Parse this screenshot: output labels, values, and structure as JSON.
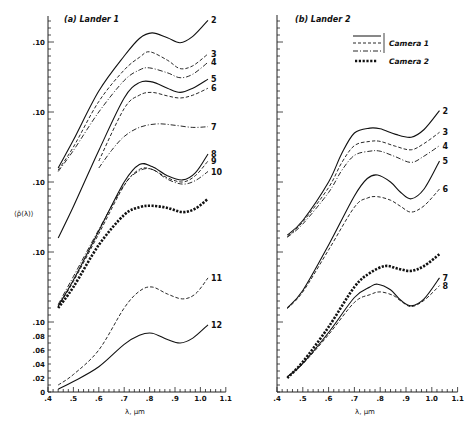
{
  "chart_data": {
    "type": "line",
    "ylabel": "⟨ρ̄(λ)⟩",
    "xlabel": "λ, μm",
    "x_ticks": [
      ".4",
      ".5",
      ".6",
      ".7",
      ".8",
      ".9",
      "1.0",
      "1.1"
    ],
    "x_tick_values": [
      0.4,
      0.5,
      0.6,
      0.7,
      0.8,
      0.9,
      1.0,
      1.1
    ],
    "xlim": [
      0.4,
      1.1
    ],
    "ylim": [
      0,
      0.54
    ],
    "y_note": "Curves are offset vertically; each '.10' label marks a repeated 0.10 reference for the stacked curves.",
    "legend": {
      "placement": "top-right of panel (b)",
      "entries": [
        {
          "label": "Camera 1",
          "styles": [
            "solid",
            "dashed",
            "dash-dot"
          ]
        },
        {
          "label": "Camera 2",
          "styles": [
            "bold-dotted"
          ]
        }
      ]
    },
    "panels": [
      {
        "title": "(a) Lander 1",
        "y_tick_labels": [
          {
            "label": "0",
            "value": 0.0
          },
          {
            "label": ".02",
            "value": 0.02
          },
          {
            "label": ".04",
            "value": 0.04
          },
          {
            "label": ".06",
            "value": 0.06
          },
          {
            "label": ".08",
            "value": 0.08
          },
          {
            "label": ".10",
            "value": 0.1
          },
          {
            "label": ".10",
            "value": 0.2
          },
          {
            "label": ".10",
            "value": 0.3
          },
          {
            "label": ".10",
            "value": 0.4
          },
          {
            "label": ".10",
            "value": 0.5
          }
        ],
        "series": [
          {
            "name": "2",
            "camera": "Camera 1",
            "style": "solid",
            "x": [
              0.44,
              0.5,
              0.6,
              0.7,
              0.76,
              0.81,
              0.87,
              0.92,
              0.97,
              1.03
            ],
            "y": [
              0.32,
              0.36,
              0.43,
              0.48,
              0.505,
              0.513,
              0.506,
              0.499,
              0.508,
              0.531
            ]
          },
          {
            "name": "3",
            "camera": "Camera 1",
            "style": "dashed",
            "x": [
              0.44,
              0.5,
              0.6,
              0.7,
              0.76,
              0.8,
              0.87,
              0.92,
              0.97,
              1.03
            ],
            "y": [
              0.317,
              0.35,
              0.415,
              0.46,
              0.478,
              0.486,
              0.474,
              0.462,
              0.466,
              0.483
            ]
          },
          {
            "name": "4",
            "camera": "Camera 1",
            "style": "dash-dot",
            "x": [
              0.44,
              0.5,
              0.6,
              0.7,
              0.76,
              0.8,
              0.87,
              0.92,
              0.97,
              1.03
            ],
            "y": [
              0.315,
              0.345,
              0.4,
              0.445,
              0.46,
              0.463,
              0.456,
              0.449,
              0.454,
              0.471
            ]
          },
          {
            "name": "5",
            "camera": "Camera 1",
            "style": "solid",
            "x": [
              0.44,
              0.5,
              0.6,
              0.7,
              0.76,
              0.81,
              0.87,
              0.92,
              0.97,
              1.03
            ],
            "y": [
              0.22,
              0.265,
              0.345,
              0.42,
              0.442,
              0.443,
              0.434,
              0.428,
              0.434,
              0.447
            ]
          },
          {
            "name": "6",
            "camera": "Camera 1",
            "style": "dashed",
            "x": [
              0.6,
              0.7,
              0.76,
              0.81,
              0.87,
              0.92,
              0.97,
              1.03
            ],
            "y": [
              0.33,
              0.405,
              0.424,
              0.428,
              0.423,
              0.42,
              0.424,
              0.434
            ]
          },
          {
            "name": "7",
            "camera": "Camera 1",
            "style": "dash-dot",
            "x": [
              0.6,
              0.65,
              0.7,
              0.76,
              0.83,
              0.9,
              0.97,
              1.03
            ],
            "y": [
              0.32,
              0.345,
              0.365,
              0.378,
              0.383,
              0.381,
              0.378,
              0.379
            ]
          },
          {
            "name": "8",
            "camera": "Camera 1",
            "style": "solid",
            "x": [
              0.44,
              0.5,
              0.6,
              0.7,
              0.76,
              0.81,
              0.87,
              0.93,
              0.98,
              1.03
            ],
            "y": [
              0.123,
              0.16,
              0.23,
              0.3,
              0.325,
              0.322,
              0.309,
              0.303,
              0.313,
              0.34
            ]
          },
          {
            "name": "9",
            "camera": "Camera 1",
            "style": "dashed",
            "x": [
              0.44,
              0.5,
              0.6,
              0.7,
              0.76,
              0.81,
              0.87,
              0.93,
              0.98,
              1.03
            ],
            "y": [
              0.122,
              0.158,
              0.226,
              0.295,
              0.318,
              0.318,
              0.306,
              0.3,
              0.309,
              0.33
            ]
          },
          {
            "name": "10",
            "camera": "Camera 1",
            "style": "dash-dot",
            "x": [
              0.44,
              0.5,
              0.6,
              0.7,
              0.76,
              0.81,
              0.87,
              0.93,
              0.98,
              1.03
            ],
            "y": [
              0.125,
              0.165,
              0.232,
              0.296,
              0.316,
              0.318,
              0.304,
              0.297,
              0.302,
              0.315
            ]
          },
          {
            "name": "Camera 2 (a)",
            "camera": "Camera 2",
            "style": "bold-dotted",
            "x": [
              0.44,
              0.5,
              0.6,
              0.7,
              0.76,
              0.81,
              0.87,
              0.93,
              0.98,
              1.03
            ],
            "y": [
              0.12,
              0.15,
              0.21,
              0.253,
              0.264,
              0.266,
              0.263,
              0.257,
              0.262,
              0.276
            ]
          },
          {
            "name": "11",
            "camera": "Camera 1",
            "style": "dashed",
            "x": [
              0.44,
              0.5,
              0.6,
              0.7,
              0.76,
              0.81,
              0.87,
              0.93,
              0.98,
              1.03
            ],
            "y": [
              0.01,
              0.025,
              0.06,
              0.12,
              0.144,
              0.15,
              0.14,
              0.133,
              0.14,
              0.163
            ]
          },
          {
            "name": "12",
            "camera": "Camera 1",
            "style": "solid",
            "x": [
              0.44,
              0.5,
              0.6,
              0.7,
              0.76,
              0.81,
              0.87,
              0.92,
              0.97,
              1.03
            ],
            "y": [
              0.004,
              0.015,
              0.036,
              0.068,
              0.081,
              0.084,
              0.075,
              0.07,
              0.077,
              0.096
            ]
          }
        ]
      },
      {
        "title": "(b) Lander 2",
        "y_tick_labels": [],
        "series": [
          {
            "name": "2",
            "camera": "Camera 1",
            "style": "solid",
            "x": [
              0.44,
              0.5,
              0.6,
              0.65,
              0.7,
              0.76,
              0.8,
              0.86,
              0.92,
              0.97,
              1.03
            ],
            "y": [
              0.224,
              0.245,
              0.3,
              0.34,
              0.37,
              0.377,
              0.376,
              0.368,
              0.364,
              0.375,
              0.402
            ]
          },
          {
            "name": "3",
            "camera": "Camera 1",
            "style": "dashed",
            "x": [
              0.44,
              0.5,
              0.6,
              0.65,
              0.7,
              0.76,
              0.8,
              0.86,
              0.92,
              0.97,
              1.03
            ],
            "y": [
              0.222,
              0.243,
              0.292,
              0.327,
              0.352,
              0.358,
              0.358,
              0.351,
              0.346,
              0.355,
              0.371
            ]
          },
          {
            "name": "4",
            "camera": "Camera 1",
            "style": "dash-dot",
            "x": [
              0.44,
              0.5,
              0.6,
              0.65,
              0.7,
              0.76,
              0.8,
              0.86,
              0.92,
              0.97,
              1.03
            ],
            "y": [
              0.221,
              0.24,
              0.285,
              0.316,
              0.338,
              0.344,
              0.344,
              0.336,
              0.328,
              0.337,
              0.352
            ]
          },
          {
            "name": "5",
            "camera": "Camera 1",
            "style": "solid",
            "x": [
              0.44,
              0.5,
              0.6,
              0.7,
              0.75,
              0.79,
              0.84,
              0.88,
              0.92,
              0.97,
              1.03
            ],
            "y": [
              0.12,
              0.145,
              0.21,
              0.28,
              0.305,
              0.31,
              0.3,
              0.285,
              0.276,
              0.29,
              0.33
            ]
          },
          {
            "name": "6",
            "camera": "Camera 1",
            "style": "dashed",
            "x": [
              0.44,
              0.5,
              0.6,
              0.7,
              0.75,
              0.79,
              0.84,
              0.88,
              0.92,
              0.97,
              1.03
            ],
            "y": [
              0.119,
              0.143,
              0.203,
              0.264,
              0.277,
              0.279,
              0.274,
              0.265,
              0.257,
              0.266,
              0.29
            ]
          },
          {
            "name": "Camera 2 (b)",
            "camera": "Camera 2",
            "style": "bold-dotted",
            "x": [
              0.44,
              0.5,
              0.6,
              0.7,
              0.76,
              0.82,
              0.87,
              0.92,
              0.97,
              1.03
            ],
            "y": [
              0.02,
              0.043,
              0.093,
              0.15,
              0.17,
              0.18,
              0.176,
              0.173,
              0.18,
              0.197
            ]
          },
          {
            "name": "7",
            "camera": "Camera 1",
            "style": "solid",
            "x": [
              0.44,
              0.5,
              0.6,
              0.7,
              0.76,
              0.79,
              0.84,
              0.88,
              0.92,
              0.97,
              1.03
            ],
            "y": [
              0.022,
              0.041,
              0.085,
              0.135,
              0.15,
              0.154,
              0.146,
              0.131,
              0.123,
              0.133,
              0.163
            ]
          },
          {
            "name": "8",
            "camera": "Camera 1",
            "style": "dashed",
            "x": [
              0.44,
              0.5,
              0.6,
              0.7,
              0.76,
              0.8,
              0.85,
              0.88,
              0.92,
              0.97,
              1.03
            ],
            "y": [
              0.021,
              0.04,
              0.082,
              0.128,
              0.139,
              0.143,
              0.138,
              0.13,
              0.122,
              0.131,
              0.152
            ]
          }
        ]
      }
    ]
  }
}
